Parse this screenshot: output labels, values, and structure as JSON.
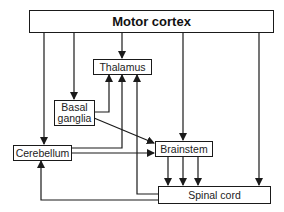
{
  "diagram": {
    "nodes": {
      "motor_cortex": "Motor cortex",
      "thalamus": "Thalamus",
      "basal_ganglia": "Basal\nganglia",
      "cerebellum": "Cerebellum",
      "brainstem": "Brainstem",
      "spinal_cord": "Spinal cord"
    },
    "edges": [
      {
        "from": "Motor cortex",
        "to": "Thalamus"
      },
      {
        "from": "Motor cortex",
        "to": "Basal ganglia"
      },
      {
        "from": "Motor cortex",
        "to": "Cerebellum"
      },
      {
        "from": "Motor cortex",
        "to": "Brainstem"
      },
      {
        "from": "Motor cortex",
        "to": "Spinal cord"
      },
      {
        "from": "Basal ganglia",
        "to": "Thalamus"
      },
      {
        "from": "Basal ganglia",
        "to": "Brainstem"
      },
      {
        "from": "Cerebellum",
        "to": "Thalamus"
      },
      {
        "from": "Cerebellum",
        "to": "Brainstem"
      },
      {
        "from": "Spinal cord",
        "to": "Thalamus"
      },
      {
        "from": "Spinal cord",
        "to": "Cerebellum"
      },
      {
        "from": "Brainstem",
        "to": "Spinal cord",
        "count": 3
      }
    ],
    "colors": {
      "line": "#1a1a1a",
      "background": "#ffffff"
    }
  }
}
